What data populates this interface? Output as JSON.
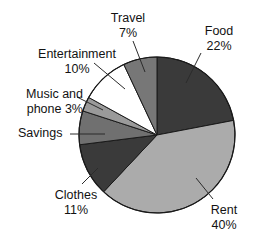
{
  "chart_data": {
    "type": "pie",
    "title": "",
    "subtitle": "",
    "xlabel": "",
    "ylabel": "",
    "grid": false,
    "legend_position": "none",
    "label_style": "outside-with-leader-lines",
    "start_angle_deg": 0,
    "direction": "clockwise",
    "categories": [
      "Food",
      "Rent",
      "Clothes",
      "Savings",
      "Music and phone",
      "Entertainment",
      "Travel"
    ],
    "values": [
      22,
      40,
      11,
      7,
      3,
      10,
      7
    ],
    "value_suffix": "%",
    "colors": [
      "#3a3a3a",
      "#ababab",
      "#3a3a3a",
      "#707070",
      "#9a9a9a",
      "#ffffff",
      "#777777"
    ],
    "slices": [
      {
        "name": "Food",
        "value": 22,
        "value_text": "22%",
        "label_line1": "Food",
        "label_line2": "22%",
        "color": "#3a3a3a",
        "percent_shown": true
      },
      {
        "name": "Rent",
        "value": 40,
        "value_text": "40%",
        "label_line1": "Rent",
        "label_line2": "40%",
        "color": "#ababab",
        "percent_shown": true
      },
      {
        "name": "Clothes",
        "value": 11,
        "value_text": "11%",
        "label_line1": "Clothes",
        "label_line2": "11%",
        "color": "#3a3a3a",
        "percent_shown": true
      },
      {
        "name": "Savings",
        "value": 7,
        "value_text": "",
        "label_line1": "Savings",
        "label_line2": "",
        "color": "#707070",
        "percent_shown": false
      },
      {
        "name": "Music and phone",
        "value": 3,
        "value_text": "3%",
        "label_line1": "Music and",
        "label_line2": "phone 3%",
        "color": "#9a9a9a",
        "percent_shown": true
      },
      {
        "name": "Entertainment",
        "value": 10,
        "value_text": "10%",
        "label_line1": "Entertainment",
        "label_line2": "10%",
        "color": "#ffffff",
        "percent_shown": true
      },
      {
        "name": "Travel",
        "value": 7,
        "value_text": "7%",
        "label_line1": "Travel",
        "label_line2": "7%",
        "color": "#777777",
        "percent_shown": true
      }
    ]
  },
  "labels": {
    "travel": {
      "line1": "Travel",
      "line2": "7%"
    },
    "food": {
      "line1": "Food",
      "line2": "22%"
    },
    "entertainment": {
      "line1": "Entertainment",
      "line2": "10%"
    },
    "music": {
      "line1": "Music and",
      "line2": "phone 3%"
    },
    "savings": {
      "line1": "Savings",
      "line2": ""
    },
    "clothes": {
      "line1": "Clothes",
      "line2": "11%"
    },
    "rent": {
      "line1": "Rent",
      "line2": "40%"
    }
  },
  "style": {
    "background": "#ffffff",
    "outline": "#1a1a1a",
    "leader_line_color": "#2b2b2b",
    "text_color": "#121212"
  }
}
